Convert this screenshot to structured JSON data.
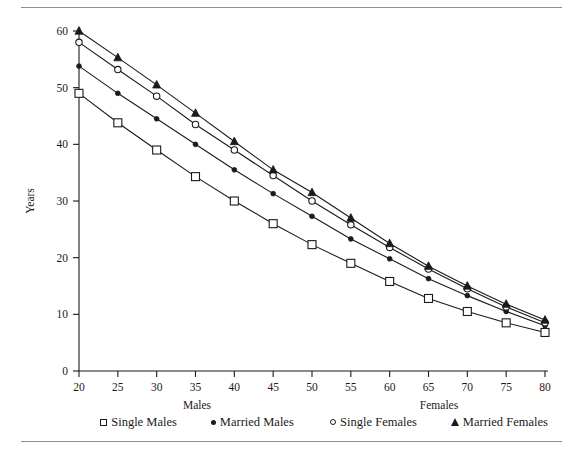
{
  "chart_data": {
    "type": "line",
    "title": "",
    "subtitle": "",
    "xlabel": "Age",
    "ylabel": "Years",
    "x": [
      20,
      25,
      30,
      35,
      40,
      45,
      50,
      55,
      60,
      65,
      70,
      75,
      80
    ],
    "xlim": [
      20,
      80
    ],
    "ylim": [
      0,
      60
    ],
    "x_ticks": [
      "20",
      "25",
      "30",
      "35",
      "40",
      "45",
      "50",
      "55",
      "60",
      "65",
      "70",
      "75",
      "80"
    ],
    "y_ticks": [
      "0",
      "10",
      "20",
      "30",
      "40",
      "50",
      "60"
    ],
    "grid": false,
    "legend_position": "bottom",
    "series": [
      {
        "name": "Single Males",
        "marker": "open-square",
        "group": "Males",
        "values": [
          49.0,
          43.8,
          39.0,
          34.3,
          30.0,
          26.0,
          22.3,
          19.0,
          15.8,
          12.8,
          10.5,
          8.5,
          6.8
        ]
      },
      {
        "name": "Married Males",
        "marker": "filled-circle",
        "group": "Males",
        "values": [
          53.8,
          49.0,
          44.5,
          40.0,
          35.5,
          31.3,
          27.3,
          23.3,
          19.8,
          16.3,
          13.3,
          10.5,
          8.0
        ]
      },
      {
        "name": "Single Females",
        "marker": "open-circle",
        "group": "Females",
        "values": [
          58.0,
          53.2,
          48.5,
          43.5,
          39.0,
          34.5,
          30.0,
          25.8,
          21.8,
          18.0,
          14.5,
          11.3,
          8.5
        ]
      },
      {
        "name": "Married Females",
        "marker": "filled-triangle",
        "group": "Females",
        "values": [
          60.0,
          55.3,
          50.5,
          45.5,
          40.5,
          35.5,
          31.5,
          27.0,
          22.5,
          18.5,
          15.0,
          11.8,
          9.0
        ]
      }
    ]
  },
  "axes": {
    "x_title": "Age",
    "y_title": "Years"
  },
  "legend": {
    "groups": [
      {
        "title": "Males",
        "entries": [
          {
            "label": "Single Males",
            "marker": "open-square"
          },
          {
            "label": "Married Males",
            "marker": "filled-circle"
          }
        ]
      },
      {
        "title": "Females",
        "entries": [
          {
            "label": "Single Females",
            "marker": "open-circle"
          },
          {
            "label": "Married Females",
            "marker": "filled-triangle"
          }
        ]
      }
    ]
  },
  "colors": {
    "ink": "#1a1a1a",
    "rule": "#8d8d8d",
    "background": "#ffffff"
  }
}
